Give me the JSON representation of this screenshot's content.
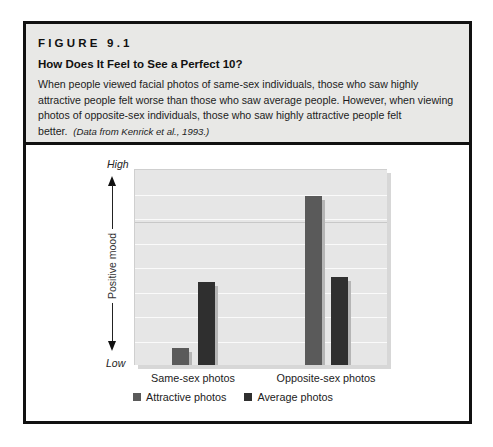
{
  "figure": {
    "label": "FIGURE 9.1",
    "title": "How Does It Feel to See a Perfect 10?",
    "caption": "When people viewed facial photos of same-sex individuals, those who saw highly attractive people felt worse than those who saw average people. However, when viewing photos of opposite-sex individuals, those who saw highly attractive people felt better.",
    "citation": "(Data from Kenrick et al., 1993.)"
  },
  "colors": {
    "header_bg": "#e8e8e6",
    "plot_bg": "#e6e6e6",
    "attractive": "#5a5a5a",
    "average": "#2f2f2f"
  },
  "chart_data": {
    "type": "bar",
    "title": "How Does It Feel to See a Perfect 10?",
    "xlabel": "",
    "ylabel": "Positive mood",
    "y_high_label": "High",
    "y_low_label": "Low",
    "ylim": [
      0,
      8
    ],
    "y_scale_note": "Unlabeled relative scale (Low to High); values estimated in gridline bands",
    "grid": true,
    "legend_position": "bottom",
    "categories": [
      "Same-sex photos",
      "Opposite-sex photos"
    ],
    "series": [
      {
        "name": "Attractive photos",
        "color": "#5a5a5a",
        "values": [
          0.7,
          6.9
        ]
      },
      {
        "name": "Average photos",
        "color": "#2f2f2f",
        "values": [
          3.4,
          3.6
        ]
      }
    ]
  }
}
